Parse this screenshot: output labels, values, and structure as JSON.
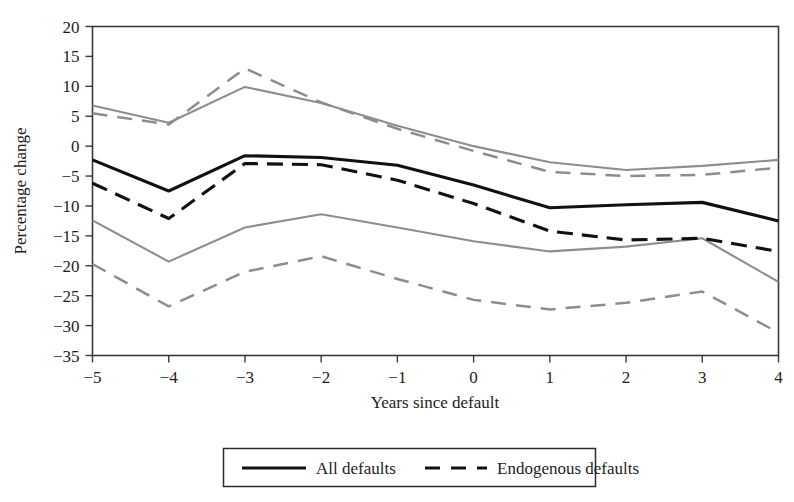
{
  "chart_data": {
    "type": "line",
    "title": "",
    "xlabel": "Years since default",
    "ylabel": "Percentage change",
    "x": [
      -5,
      -4,
      -3,
      -2,
      -1,
      0,
      1,
      2,
      3,
      4
    ],
    "xticklabels": [
      "−5",
      "−4",
      "−3",
      "−2",
      "−1",
      "0",
      "1",
      "2",
      "3",
      "4"
    ],
    "yticklabels": [
      "20",
      "15",
      "10",
      "5",
      "0",
      "−5",
      "−10",
      "−15",
      "−20",
      "−25",
      "−30",
      "−35"
    ],
    "yticks": [
      20,
      15,
      10,
      5,
      0,
      -5,
      -10,
      -15,
      -20,
      -25,
      -30,
      -35
    ],
    "xlim": [
      -5,
      4
    ],
    "ylim": [
      -35,
      20
    ],
    "grid": false,
    "legend_position": "bottom-outside",
    "series": [
      {
        "name": "All defaults",
        "role": "mean",
        "style": "solid",
        "color": "#111111",
        "values": [
          -2.3,
          -7.5,
          -1.6,
          -1.9,
          -3.2,
          -6.5,
          -10.3,
          -9.8,
          -9.4,
          -12.5
        ]
      },
      {
        "name": "All defaults upper CI",
        "role": "upper-bound",
        "style": "solid",
        "color": "#8d8d8d",
        "values": [
          6.8,
          3.9,
          9.9,
          7.2,
          3.4,
          0.0,
          -2.7,
          -4.0,
          -3.3,
          -2.3
        ]
      },
      {
        "name": "All defaults lower CI",
        "role": "lower-bound",
        "style": "solid",
        "color": "#8d8d8d",
        "values": [
          -12.4,
          -19.3,
          -13.6,
          -11.4,
          -13.6,
          -15.9,
          -17.6,
          -16.8,
          -15.4,
          -22.7
        ]
      },
      {
        "name": "Endogenous defaults",
        "role": "mean",
        "style": "dashed",
        "color": "#111111",
        "values": [
          -6.2,
          -12.1,
          -2.9,
          -3.1,
          -5.7,
          -9.6,
          -14.2,
          -15.7,
          -15.4,
          -17.6
        ]
      },
      {
        "name": "Endogenous defaults upper CI",
        "role": "upper-bound",
        "style": "dashed",
        "color": "#8d8d8d",
        "values": [
          5.5,
          3.6,
          13.0,
          7.3,
          2.9,
          -0.8,
          -4.3,
          -5.0,
          -4.8,
          -3.6
        ]
      },
      {
        "name": "Endogenous defaults lower CI",
        "role": "lower-bound",
        "style": "dashed",
        "color": "#8d8d8d",
        "values": [
          -19.7,
          -26.8,
          -21.0,
          -18.4,
          -22.2,
          -25.7,
          -27.3,
          -26.2,
          -24.3,
          -31.2
        ]
      }
    ],
    "legend": [
      {
        "label": "All defaults",
        "style": "solid",
        "color": "#111111"
      },
      {
        "label": "Endogenous defaults",
        "style": "dashed",
        "color": "#111111"
      }
    ]
  }
}
